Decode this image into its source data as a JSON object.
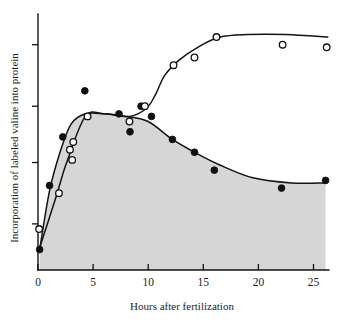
{
  "figure": {
    "background_color": "#ffffff",
    "ink_color": "#131313",
    "shade_color": "#d6d6d6"
  },
  "chart_data": {
    "type": "line",
    "title": "",
    "subtitle": "",
    "xlabel": "Hours after fertilization",
    "ylabel": "Incorporation of labeled valine into protein",
    "xlim": [
      0,
      26.5
    ],
    "ylim": [
      0,
      100
    ],
    "grid": false,
    "legend": "none",
    "x_ticks": [
      0,
      5,
      10,
      15,
      20,
      25
    ],
    "x_tick_labels": [
      "0",
      "5",
      "10",
      "15",
      "20",
      "25"
    ],
    "y_ticks": [
      18,
      42,
      64,
      88
    ],
    "y_tick_labels": [
      "",
      "",
      "",
      ""
    ],
    "series": [
      {
        "name": "filled-circles",
        "marker": "filled-circle",
        "shaded_area": true,
        "points": [
          {
            "x": 0.15,
            "y": 8
          },
          {
            "x": 1.05,
            "y": 33
          },
          {
            "x": 2.25,
            "y": 52
          },
          {
            "x": 4.25,
            "y": 70
          },
          {
            "x": 7.35,
            "y": 61
          },
          {
            "x": 8.35,
            "y": 54
          },
          {
            "x": 9.35,
            "y": 64
          },
          {
            "x": 10.3,
            "y": 60
          },
          {
            "x": 12.2,
            "y": 51
          },
          {
            "x": 14.2,
            "y": 46
          },
          {
            "x": 16.0,
            "y": 39
          },
          {
            "x": 22.1,
            "y": 32
          },
          {
            "x": 26.1,
            "y": 35
          }
        ],
        "curve": [
          {
            "x": 0.15,
            "y": 8
          },
          {
            "x": 1.05,
            "y": 31
          },
          {
            "x": 2.0,
            "y": 46
          },
          {
            "x": 3.0,
            "y": 57
          },
          {
            "x": 4.3,
            "y": 61
          },
          {
            "x": 6.0,
            "y": 61
          },
          {
            "x": 8.0,
            "y": 60
          },
          {
            "x": 10.0,
            "y": 58
          },
          {
            "x": 12.2,
            "y": 51
          },
          {
            "x": 14.2,
            "y": 46
          },
          {
            "x": 16.5,
            "y": 41
          },
          {
            "x": 19.5,
            "y": 36
          },
          {
            "x": 23.0,
            "y": 34
          },
          {
            "x": 26.1,
            "y": 34
          }
        ]
      },
      {
        "name": "open-circles",
        "marker": "open-circle",
        "shaded_area": false,
        "points": [
          {
            "x": 0.1,
            "y": 16
          },
          {
            "x": 1.9,
            "y": 30
          },
          {
            "x": 2.9,
            "y": 47
          },
          {
            "x": 3.1,
            "y": 43
          },
          {
            "x": 3.2,
            "y": 50
          },
          {
            "x": 4.5,
            "y": 60
          },
          {
            "x": 8.3,
            "y": 58
          },
          {
            "x": 9.7,
            "y": 64
          },
          {
            "x": 12.3,
            "y": 80
          },
          {
            "x": 14.2,
            "y": 83
          },
          {
            "x": 16.2,
            "y": 91
          },
          {
            "x": 22.2,
            "y": 88
          },
          {
            "x": 26.2,
            "y": 87
          }
        ],
        "curve": [
          {
            "x": 0.1,
            "y": 8
          },
          {
            "x": 1.6,
            "y": 28
          },
          {
            "x": 2.6,
            "y": 42
          },
          {
            "x": 4.3,
            "y": 60
          },
          {
            "x": 6.0,
            "y": 61
          },
          {
            "x": 8.3,
            "y": 60
          },
          {
            "x": 9.8,
            "y": 63
          },
          {
            "x": 10.6,
            "y": 68
          },
          {
            "x": 11.5,
            "y": 76
          },
          {
            "x": 12.8,
            "y": 82
          },
          {
            "x": 14.5,
            "y": 87
          },
          {
            "x": 16.5,
            "y": 91
          },
          {
            "x": 19.0,
            "y": 92
          },
          {
            "x": 22.5,
            "y": 92
          },
          {
            "x": 26.3,
            "y": 91
          }
        ]
      }
    ]
  }
}
